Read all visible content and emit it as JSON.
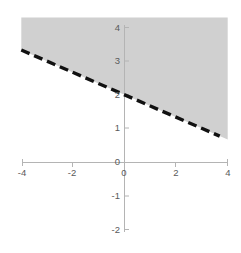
{
  "chart_data": {
    "type": "line",
    "title": "",
    "xlabel": "",
    "ylabel": "",
    "xlim": [
      -4,
      4
    ],
    "ylim": [
      -2,
      4
    ],
    "grid": false,
    "legend": null,
    "x_ticks": [
      -4,
      -2,
      0,
      2,
      4
    ],
    "x_tick_labels": [
      "-4",
      "-2",
      "0",
      "2",
      "4"
    ],
    "y_ticks": [
      -2,
      -1,
      0,
      1,
      2,
      3,
      4
    ],
    "y_tick_labels": [
      "-2",
      "-1",
      "0",
      "1",
      "2",
      "3",
      "4"
    ],
    "origin_label": "0",
    "series": [
      {
        "name": "boundary-line",
        "type": "line",
        "linestyle": "dashed",
        "color": "#111111",
        "linewidth": 3,
        "slope": -0.3333,
        "intercept": 2,
        "equation": "y = -x/3 + 2",
        "x": [
          -4,
          4
        ],
        "y": [
          3.3333,
          0.6667
        ],
        "points": [
          {
            "x": -4,
            "y": 3.33
          },
          {
            "x": -3,
            "y": 3.0
          },
          {
            "x": -2,
            "y": 2.67
          },
          {
            "x": -1,
            "y": 2.33
          },
          {
            "x": 0,
            "y": 2.0
          },
          {
            "x": 1,
            "y": 1.67
          },
          {
            "x": 2,
            "y": 1.33
          },
          {
            "x": 3,
            "y": 1.0
          },
          {
            "x": 4,
            "y": 0.67
          }
        ]
      }
    ],
    "shaded_region": {
      "name": "solution-region",
      "description": "region above the dashed boundary line",
      "inequality": "y > -x/3 + 2",
      "fill_color": "#d0d0d0",
      "boundary_included": false,
      "top_y": 4.3
    },
    "axis_color": "#b0b0b0",
    "tick_label_color": "#5a5a5a"
  }
}
